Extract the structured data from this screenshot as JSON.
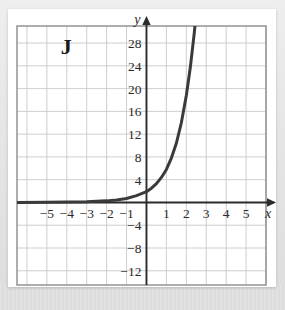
{
  "figure": {
    "label": "J",
    "background_color": "#ffffff",
    "page_background_color": "#e9e9e9"
  },
  "chart_data": {
    "type": "line",
    "title": "",
    "subtitle": "",
    "xlabel": "x",
    "ylabel": "y",
    "grid": true,
    "legend": null,
    "annotations": [
      {
        "text": "J",
        "role": "figure-label",
        "x": -4.3,
        "y": 26
      }
    ],
    "xlim": [
      -6.5,
      6.0
    ],
    "ylim": [
      -14.5,
      31.0
    ],
    "x_ticks": [
      -5,
      -4,
      -3,
      -2,
      -1,
      1,
      2,
      3,
      4,
      5
    ],
    "x_tick_labels": [
      "−5",
      "−4",
      "−3",
      "−2",
      "−1",
      "1",
      "2",
      "3",
      "4",
      "5"
    ],
    "y_ticks": [
      28,
      24,
      20,
      16,
      12,
      8,
      4,
      -4,
      -8,
      -12
    ],
    "y_tick_labels": [
      "28",
      "24",
      "20",
      "16",
      "12",
      "8",
      "4",
      "−4",
      "−8",
      "−12"
    ],
    "x_gridline_step": 1,
    "y_gridline_step": 4,
    "axis_arrows": [
      "x-positive",
      "y-positive"
    ],
    "series": [
      {
        "name": "exponential curve",
        "color": "#3a3a3a",
        "line_width": 3,
        "points": [
          {
            "x": -6.5,
            "y": 0.01
          },
          {
            "x": -5.0,
            "y": 0.03
          },
          {
            "x": -4.0,
            "y": 0.06
          },
          {
            "x": -3.0,
            "y": 0.12
          },
          {
            "x": -2.0,
            "y": 0.28
          },
          {
            "x": -1.5,
            "y": 0.45
          },
          {
            "x": -1.0,
            "y": 0.7
          },
          {
            "x": -0.5,
            "y": 1.2
          },
          {
            "x": 0.0,
            "y": 1.9
          },
          {
            "x": 0.25,
            "y": 2.5
          },
          {
            "x": 0.5,
            "y": 3.3
          },
          {
            "x": 0.75,
            "y": 4.4
          },
          {
            "x": 1.0,
            "y": 5.8
          },
          {
            "x": 1.25,
            "y": 7.8
          },
          {
            "x": 1.5,
            "y": 10.4
          },
          {
            "x": 1.75,
            "y": 14.0
          },
          {
            "x": 2.0,
            "y": 18.8
          },
          {
            "x": 2.2,
            "y": 23.7
          },
          {
            "x": 2.4,
            "y": 29.8
          },
          {
            "x": 2.5,
            "y": 33.5
          }
        ]
      }
    ]
  }
}
